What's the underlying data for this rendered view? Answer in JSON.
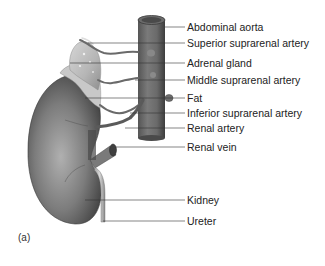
{
  "figure": {
    "panel_label": "(a)",
    "labels": [
      {
        "id": "abdominal-aorta",
        "text": "Abdominal aorta",
        "y": 27
      },
      {
        "id": "superior-suprarenal-artery",
        "text": "Superior suprarenal artery",
        "y": 43
      },
      {
        "id": "adrenal-gland",
        "text": "Adrenal gland",
        "y": 63
      },
      {
        "id": "middle-suprarenal-artery",
        "text": "Middle suprarenal artery",
        "y": 80
      },
      {
        "id": "fat",
        "text": "Fat",
        "y": 98
      },
      {
        "id": "inferior-suprarenal-artery",
        "text": "Inferior suprarenal artery",
        "y": 113
      },
      {
        "id": "renal-artery",
        "text": "Renal artery",
        "y": 128
      },
      {
        "id": "renal-vein",
        "text": "Renal vein",
        "y": 147
      },
      {
        "id": "kidney",
        "text": "Kidney",
        "y": 200
      },
      {
        "id": "ureter",
        "text": "Ureter",
        "y": 221
      }
    ]
  }
}
